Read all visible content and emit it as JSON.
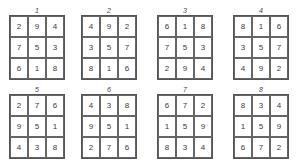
{
  "squares": [
    {
      "label": "1",
      "cells": [
        "2",
        "9",
        "4",
        "7",
        "5",
        "3",
        "6",
        "1",
        "8"
      ]
    },
    {
      "label": "2",
      "cells": [
        "4",
        "9",
        "2",
        "3",
        "5",
        "7",
        "8",
        "1",
        "6"
      ]
    },
    {
      "label": "3",
      "cells": [
        "6",
        "1",
        "8",
        "7",
        "5",
        "3",
        "2",
        "9",
        "4"
      ]
    },
    {
      "label": "4",
      "cells": [
        "8",
        "1",
        "6",
        "3",
        "5",
        "7",
        "4",
        "9",
        "2"
      ]
    },
    {
      "label": "5",
      "cells": [
        "2",
        "7",
        "6",
        "9",
        "5",
        "1",
        "4",
        "3",
        "8"
      ]
    },
    {
      "label": "6",
      "cells": [
        "4",
        "3",
        "8",
        "9",
        "5",
        "1",
        "2",
        "7",
        "6"
      ]
    },
    {
      "label": "7",
      "cells": [
        "6",
        "7",
        "2",
        "1",
        "5",
        "9",
        "8",
        "3",
        "4"
      ]
    },
    {
      "label": "8",
      "cells": [
        "8",
        "3",
        "4",
        "1",
        "5",
        "9",
        "6",
        "7",
        "2"
      ]
    }
  ]
}
